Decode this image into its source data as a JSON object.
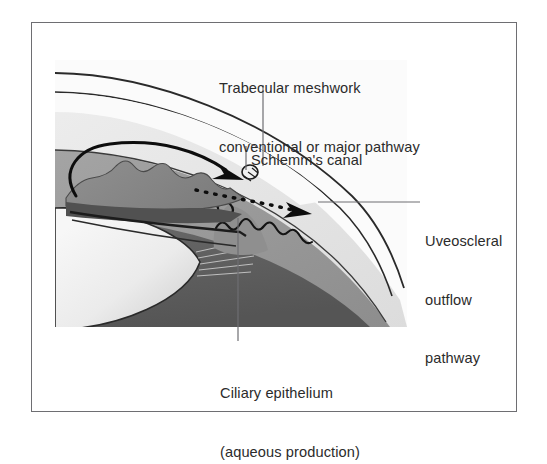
{
  "figure": {
    "type": "anatomical-cross-section",
    "border_color": "#6e6e72",
    "background": "#ffffff"
  },
  "labels": {
    "trabecular": {
      "name": "trabecular-meshwork-label",
      "line1": "Trabecular meshwork",
      "line2": "conventional or major pathway"
    },
    "schlemm": {
      "name": "schlemms-canal-label",
      "line1": "Schlemm's canal"
    },
    "uveoscleral": {
      "name": "uveoscleral-outflow-label",
      "line1": "Uveoscleral",
      "line2": "outflow",
      "line3": "pathway"
    },
    "ciliary": {
      "name": "ciliary-epithelium-label",
      "line1": "Ciliary epithelium",
      "line2": "(aqueous production)"
    }
  },
  "anatomy": {
    "structures": [
      "cornea",
      "anterior-chamber",
      "iris",
      "schlemms-canal",
      "trabecular-meshwork",
      "ciliary-body",
      "ciliary-processes",
      "zonule-fibers",
      "lens",
      "sclera",
      "choroid",
      "vitreous"
    ],
    "flow_arrows": [
      {
        "name": "conventional-outflow-arrow",
        "style": "solid",
        "description": "curved solid arrow looping around iris toward Schlemm's canal"
      },
      {
        "name": "uveoscleral-outflow-arrow",
        "style": "dotted",
        "description": "dotted arrow passing through ciliary body into suprachoroidal space"
      }
    ]
  },
  "palette": {
    "text": "#2b2b2b",
    "leader_line": "#6e6e72",
    "outline": "#1a1a1a",
    "cornea": "#f4f4f4",
    "anterior_chamber": "#fbfbfb",
    "iris": "#8a8a8a",
    "iris_dark": "#5d5d5d",
    "sclera": "#e2e2e2",
    "choroid": "#9a9a9a",
    "vitreous": "#5a5a5a",
    "lens_light": "#f2f2f2",
    "lens_mid": "#d8d8d8",
    "ciliary": "#8f8f8f"
  }
}
